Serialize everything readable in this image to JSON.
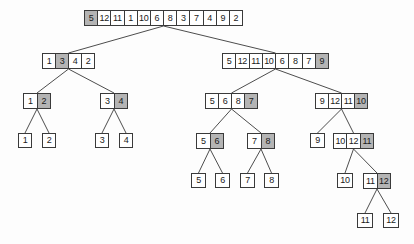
{
  "diagram": {
    "type": "tree",
    "colors": {
      "background": "#fdfdfd",
      "cell_background": "#ffffff",
      "cell_border": "#3a3a3a",
      "shaded_cell": "#b4b4b4",
      "edge_line": "#4d4d4d"
    },
    "nodes": [
      {
        "id": "root",
        "x": 84,
        "y": 10,
        "w": 159,
        "h": 16,
        "values": [
          "5",
          "12",
          "11",
          "1",
          "10",
          "6",
          "8",
          "3",
          "7",
          "4",
          "9",
          "2"
        ],
        "shaded": 0
      },
      {
        "id": "L",
        "x": 42,
        "y": 53,
        "w": 53,
        "h": 16,
        "values": [
          "1",
          "3",
          "4",
          "2"
        ],
        "shaded": 1
      },
      {
        "id": "R",
        "x": 222,
        "y": 53,
        "w": 107,
        "h": 16,
        "values": [
          "5",
          "12",
          "11",
          "10",
          "6",
          "8",
          "7",
          "9"
        ],
        "shaded": 7
      },
      {
        "id": "LL",
        "x": 23,
        "y": 93,
        "w": 28,
        "h": 16,
        "values": [
          "1",
          "2"
        ],
        "shaded": 1
      },
      {
        "id": "LR",
        "x": 100,
        "y": 93,
        "w": 28,
        "h": 16,
        "values": [
          "3",
          "4"
        ],
        "shaded": 1
      },
      {
        "id": "RL",
        "x": 205,
        "y": 93,
        "w": 53,
        "h": 16,
        "values": [
          "5",
          "6",
          "8",
          "7"
        ],
        "shaded": 3
      },
      {
        "id": "RR",
        "x": 315,
        "y": 93,
        "w": 53,
        "h": 16,
        "values": [
          "9",
          "12",
          "11",
          "10"
        ],
        "shaded": 3
      },
      {
        "id": "LLL",
        "x": 18,
        "y": 133,
        "w": 14,
        "h": 15,
        "values": [
          "1"
        ],
        "shaded": null
      },
      {
        "id": "LLR",
        "x": 42,
        "y": 133,
        "w": 14,
        "h": 15,
        "values": [
          "2"
        ],
        "shaded": null
      },
      {
        "id": "LRL",
        "x": 95,
        "y": 133,
        "w": 14,
        "h": 15,
        "values": [
          "3"
        ],
        "shaded": null
      },
      {
        "id": "LRR",
        "x": 119,
        "y": 133,
        "w": 14,
        "h": 15,
        "values": [
          "4"
        ],
        "shaded": null
      },
      {
        "id": "RLL",
        "x": 196,
        "y": 133,
        "w": 28,
        "h": 16,
        "values": [
          "5",
          "6"
        ],
        "shaded": 1
      },
      {
        "id": "RLR",
        "x": 247,
        "y": 133,
        "w": 28,
        "h": 16,
        "values": [
          "7",
          "8"
        ],
        "shaded": 1
      },
      {
        "id": "RRL",
        "x": 310,
        "y": 133,
        "w": 15,
        "h": 15,
        "values": [
          "9"
        ],
        "shaded": null
      },
      {
        "id": "RRR",
        "x": 333,
        "y": 133,
        "w": 41,
        "h": 16,
        "values": [
          "10",
          "12",
          "11"
        ],
        "shaded": 2
      },
      {
        "id": "RLLL",
        "x": 191,
        "y": 173,
        "w": 15,
        "h": 15,
        "values": [
          "5"
        ],
        "shaded": null
      },
      {
        "id": "RLLR",
        "x": 215,
        "y": 173,
        "w": 15,
        "h": 15,
        "values": [
          "6"
        ],
        "shaded": null
      },
      {
        "id": "RLRL",
        "x": 240,
        "y": 173,
        "w": 15,
        "h": 15,
        "values": [
          "7"
        ],
        "shaded": null
      },
      {
        "id": "RLRR",
        "x": 264,
        "y": 173,
        "w": 15,
        "h": 15,
        "values": [
          "8"
        ],
        "shaded": null
      },
      {
        "id": "RRRL",
        "x": 337,
        "y": 173,
        "w": 16,
        "h": 15,
        "values": [
          "10"
        ],
        "shaded": null
      },
      {
        "id": "RRRR",
        "x": 363,
        "y": 173,
        "w": 28,
        "h": 16,
        "values": [
          "11",
          "12"
        ],
        "shaded": 1
      },
      {
        "id": "RRRRL",
        "x": 357,
        "y": 213,
        "w": 16,
        "h": 15,
        "values": [
          "11"
        ],
        "shaded": null
      },
      {
        "id": "RRRRR",
        "x": 383,
        "y": 213,
        "w": 16,
        "h": 15,
        "values": [
          "12"
        ],
        "shaded": null
      }
    ],
    "edges": [
      [
        "root",
        "L"
      ],
      [
        "root",
        "R"
      ],
      [
        "L",
        "LL"
      ],
      [
        "L",
        "LR"
      ],
      [
        "R",
        "RL"
      ],
      [
        "R",
        "RR"
      ],
      [
        "LL",
        "LLL"
      ],
      [
        "LL",
        "LLR"
      ],
      [
        "LR",
        "LRL"
      ],
      [
        "LR",
        "LRR"
      ],
      [
        "RL",
        "RLL"
      ],
      [
        "RL",
        "RLR"
      ],
      [
        "RR",
        "RRL"
      ],
      [
        "RR",
        "RRR"
      ],
      [
        "RLL",
        "RLLL"
      ],
      [
        "RLL",
        "RLLR"
      ],
      [
        "RLR",
        "RLRL"
      ],
      [
        "RLR",
        "RLRR"
      ],
      [
        "RRR",
        "RRRL"
      ],
      [
        "RRR",
        "RRRR"
      ],
      [
        "RRRR",
        "RRRRL"
      ],
      [
        "RRRR",
        "RRRRR"
      ]
    ]
  }
}
